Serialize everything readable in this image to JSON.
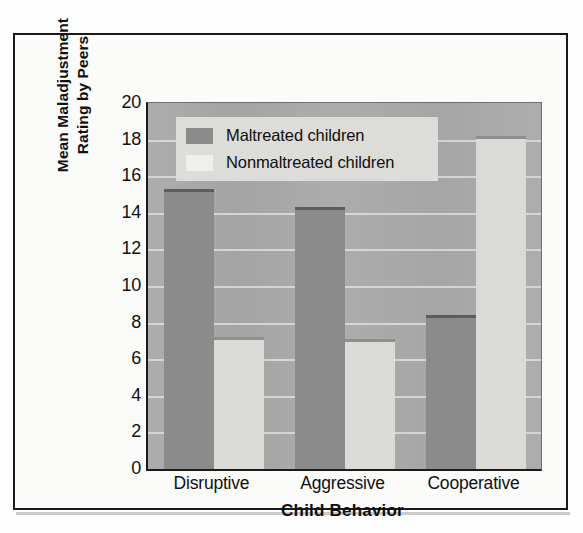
{
  "figure": {
    "caption_none": "",
    "frame_style": "black-rule-box"
  },
  "chart_data": {
    "type": "bar",
    "title": "",
    "xlabel": "Child Behavior",
    "ylabel": "Mean Maladjustment\nRating by Peers",
    "categories": [
      "Disruptive",
      "Aggressive",
      "Cooperative"
    ],
    "series": [
      {
        "name": "Maltreated children",
        "values": [
          15.3,
          14.3,
          8.4
        ],
        "color": "#8b8b8b"
      },
      {
        "name": "Nonmaltreated children",
        "values": [
          7.2,
          7.1,
          18.2
        ],
        "color": "#dadad6"
      }
    ],
    "ylim": [
      0,
      20
    ],
    "ytick_labels": [
      "20",
      "18",
      "16",
      "14",
      "12",
      "10",
      "8",
      "6",
      "4",
      "2",
      "0"
    ],
    "ytick_values": [
      20,
      18,
      16,
      14,
      12,
      10,
      8,
      6,
      4,
      2,
      0
    ],
    "ytick_step": 2,
    "grid": true,
    "grid_axis": "y",
    "grid_color": "#e6e6e6",
    "plot_background": "#a9a9a9",
    "legend_position": "upper-left-inside",
    "legend_background": "#dcdcd8",
    "bar_group_count": 3,
    "bars_per_group": 2
  },
  "legend": {
    "entries": [
      {
        "label": "Maltreated children",
        "swatch": "dark"
      },
      {
        "label": "Nonmaltreated children",
        "swatch": "light"
      }
    ]
  },
  "axes": {
    "y_title": "Mean Maladjustment\nRating by Peers",
    "x_title": "Child Behavior",
    "y_ticks": [
      "20",
      "18",
      "16",
      "14",
      "12",
      "10",
      "8",
      "6",
      "4",
      "2",
      "0"
    ],
    "x_ticks": [
      "Disruptive",
      "Aggressive",
      "Cooperative"
    ]
  }
}
